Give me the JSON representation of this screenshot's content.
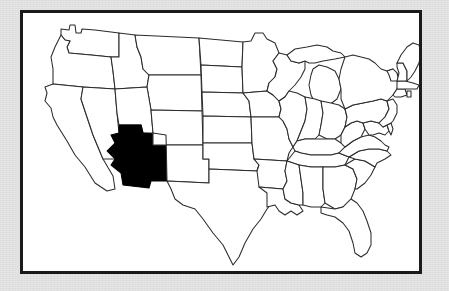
{
  "figure": {
    "type": "choropleth-outline-map",
    "region": "United States",
    "projection_note": "contiguous 48 states",
    "background_color": "#e4e4e4",
    "frame_color": "#1a1a1a",
    "land_fill_color": "#ffffff",
    "border_color": "#2b2b2b",
    "highlight_color": "#000000",
    "highlighted_states": [
      "Arizona"
    ],
    "title": "",
    "caption": "",
    "legend": []
  },
  "states": [
    {
      "code": "WA",
      "name": "Washington",
      "highlighted": false
    },
    {
      "code": "OR",
      "name": "Oregon",
      "highlighted": false
    },
    {
      "code": "CA",
      "name": "California",
      "highlighted": false
    },
    {
      "code": "NV",
      "name": "Nevada",
      "highlighted": false
    },
    {
      "code": "ID",
      "name": "Idaho",
      "highlighted": false
    },
    {
      "code": "MT",
      "name": "Montana",
      "highlighted": false
    },
    {
      "code": "WY",
      "name": "Wyoming",
      "highlighted": false
    },
    {
      "code": "UT",
      "name": "Utah",
      "highlighted": false
    },
    {
      "code": "AZ",
      "name": "Arizona",
      "highlighted": true
    },
    {
      "code": "CO",
      "name": "Colorado",
      "highlighted": false
    },
    {
      "code": "NM",
      "name": "New Mexico",
      "highlighted": false
    },
    {
      "code": "ND",
      "name": "North Dakota",
      "highlighted": false
    },
    {
      "code": "SD",
      "name": "South Dakota",
      "highlighted": false
    },
    {
      "code": "NE",
      "name": "Nebraska",
      "highlighted": false
    },
    {
      "code": "KS",
      "name": "Kansas",
      "highlighted": false
    },
    {
      "code": "OK",
      "name": "Oklahoma",
      "highlighted": false
    },
    {
      "code": "TX",
      "name": "Texas",
      "highlighted": false
    },
    {
      "code": "MN",
      "name": "Minnesota",
      "highlighted": false
    },
    {
      "code": "IA",
      "name": "Iowa",
      "highlighted": false
    },
    {
      "code": "MO",
      "name": "Missouri",
      "highlighted": false
    },
    {
      "code": "AR",
      "name": "Arkansas",
      "highlighted": false
    },
    {
      "code": "LA",
      "name": "Louisiana",
      "highlighted": false
    },
    {
      "code": "WI",
      "name": "Wisconsin",
      "highlighted": false
    },
    {
      "code": "IL",
      "name": "Illinois",
      "highlighted": false
    },
    {
      "code": "MI",
      "name": "Michigan",
      "highlighted": false
    },
    {
      "code": "IN",
      "name": "Indiana",
      "highlighted": false
    },
    {
      "code": "OH",
      "name": "Ohio",
      "highlighted": false
    },
    {
      "code": "KY",
      "name": "Kentucky",
      "highlighted": false
    },
    {
      "code": "TN",
      "name": "Tennessee",
      "highlighted": false
    },
    {
      "code": "MS",
      "name": "Mississippi",
      "highlighted": false
    },
    {
      "code": "AL",
      "name": "Alabama",
      "highlighted": false
    },
    {
      "code": "GA",
      "name": "Georgia",
      "highlighted": false
    },
    {
      "code": "FL",
      "name": "Florida",
      "highlighted": false
    },
    {
      "code": "SC",
      "name": "South Carolina",
      "highlighted": false
    },
    {
      "code": "NC",
      "name": "North Carolina",
      "highlighted": false
    },
    {
      "code": "VA",
      "name": "Virginia",
      "highlighted": false
    },
    {
      "code": "WV",
      "name": "West Virginia",
      "highlighted": false
    },
    {
      "code": "MD",
      "name": "Maryland",
      "highlighted": false
    },
    {
      "code": "DE",
      "name": "Delaware",
      "highlighted": false
    },
    {
      "code": "PA",
      "name": "Pennsylvania",
      "highlighted": false
    },
    {
      "code": "NJ",
      "name": "New Jersey",
      "highlighted": false
    },
    {
      "code": "NY",
      "name": "New York",
      "highlighted": false
    },
    {
      "code": "CT",
      "name": "Connecticut",
      "highlighted": false
    },
    {
      "code": "RI",
      "name": "Rhode Island",
      "highlighted": false
    },
    {
      "code": "MA",
      "name": "Massachusetts",
      "highlighted": false
    },
    {
      "code": "VT",
      "name": "Vermont",
      "highlighted": false
    },
    {
      "code": "NH",
      "name": "New Hampshire",
      "highlighted": false
    },
    {
      "code": "ME",
      "name": "Maine",
      "highlighted": false
    }
  ]
}
